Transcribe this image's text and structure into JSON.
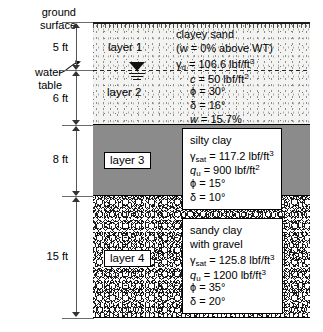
{
  "diagram": {
    "ground_surface_label": "ground\nsurface",
    "water_table_label": "water\ntable"
  },
  "annotations": {
    "ground_surface_line1": "ground",
    "ground_surface_line2": "surface",
    "water_table_line1": "water",
    "water_table_line2": "table"
  },
  "dimensions": [
    {
      "label": "5 ft",
      "layer": "layer 1"
    },
    {
      "label": "6 ft",
      "layer": "layer 2"
    },
    {
      "label": "8 ft",
      "layer": "layer 3"
    },
    {
      "label": "15 ft",
      "layer": "layer 4"
    }
  ],
  "layers": [
    {
      "tag": "layer 1",
      "thickness": "5 ft",
      "fill": "fine-stipple-sand",
      "soil_name": "clayey sand",
      "note": "(w = 0% above WT)",
      "properties": [
        {
          "symbol": "γ",
          "subscript": "d",
          "value": "106.6 lbf/ft",
          "exponent": "3"
        }
      ]
    },
    {
      "tag": "layer 2",
      "thickness": "6 ft",
      "fill": "fine-stipple-sand",
      "soil_name": "clayey sand",
      "properties": [
        {
          "symbol": "c",
          "subscript": "",
          "value": "50 lbf/ft",
          "exponent": "2"
        },
        {
          "symbol": "ϕ",
          "subscript": "",
          "value": "30°",
          "exponent": ""
        },
        {
          "symbol": "δ",
          "subscript": "",
          "value": "16°",
          "exponent": ""
        },
        {
          "symbol": "w",
          "subscript": "",
          "value": "15.7%",
          "exponent": ""
        }
      ]
    },
    {
      "tag": "layer 3",
      "thickness": "8 ft",
      "fill": "solid-grey-clay",
      "soil_name": "silty clay",
      "properties": [
        {
          "symbol": "γ",
          "subscript": "sat",
          "value": "117.2 lbf/ft",
          "exponent": "3"
        },
        {
          "symbol": "q",
          "subscript": "u",
          "value": "900 lbf/ft",
          "exponent": "2"
        },
        {
          "symbol": "ϕ",
          "subscript": "",
          "value": "15°",
          "exponent": ""
        },
        {
          "symbol": "δ",
          "subscript": "",
          "value": "10°",
          "exponent": ""
        }
      ]
    },
    {
      "tag": "layer 4",
      "thickness": "15 ft",
      "fill": "gravel-cobble",
      "soil_name_line1": "sandy clay",
      "soil_name_line2": "with gravel",
      "properties": [
        {
          "symbol": "γ",
          "subscript": "sat",
          "value": "125.8 lbf/ft",
          "exponent": "3"
        },
        {
          "symbol": "q",
          "subscript": "u",
          "value": "1200 lbf/ft",
          "exponent": "3"
        },
        {
          "symbol": "ϕ",
          "subscript": "",
          "value": "35°",
          "exponent": ""
        },
        {
          "symbol": "δ",
          "subscript": "",
          "value": "20°",
          "exponent": ""
        }
      ]
    }
  ],
  "text": {
    "l1_name": "clayey sand",
    "l1_note": "(w = 0% above WT)",
    "l1_gamma_val": "= 106.6 lbf/ft",
    "l2_c_val": "= 50 lbf/ft",
    "l2_phi_val": "= 30°",
    "l2_delta_val": "= 16°",
    "l2_w_val": "= 15.7%",
    "l3_name": "silty clay",
    "l3_gamma_val": "= 117.2 lbf/ft",
    "l3_qu_val": "= 900 lbf/ft",
    "l3_phi_val": "= 15°",
    "l3_delta_val": "= 10°",
    "l4_name1": "sandy clay",
    "l4_name2": "with gravel",
    "l4_gamma_val": "= 125.8 lbf/ft",
    "l4_qu_val": "= 1200 lbf/ft",
    "l4_phi_val": "= 35°",
    "l4_delta_val": "= 20°"
  },
  "symbols": {
    "gamma": "γ",
    "phi": "ϕ",
    "delta": "δ",
    "c": "c",
    "q": "q",
    "w": "w",
    "sub_d": "d",
    "sub_sat": "sat",
    "sub_u": "u",
    "sup_2": "2",
    "sup_3": "3"
  },
  "colors": {
    "clay_grey": "#8b8b8b",
    "sand_bg": "#f3f3f1",
    "line": "#000000",
    "dimension_line": "#555555"
  }
}
